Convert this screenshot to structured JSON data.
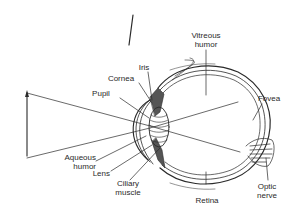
{
  "diagram": {
    "colors": {
      "ink": "#2a2a2a",
      "background": "#ffffff",
      "shade": "#555555"
    },
    "labels": {
      "iris": "Iris",
      "cornea": "Cornea",
      "pupil": "Pupil",
      "vitreous_line1": "Vitreous",
      "vitreous_line2": "humor",
      "fovea": "Fovea",
      "aqueous_line1": "Aqueous",
      "aqueous_line2": "humor",
      "lens": "Lens",
      "ciliary_line1": "Ciliary",
      "ciliary_line2": "muscle",
      "retina": "Retina",
      "optic_line1": "Optic",
      "optic_line2": "nerve"
    },
    "elements": [
      "object-arrow",
      "light-rays",
      "cornea",
      "iris",
      "lens",
      "eyeball-wall",
      "optic-nerve",
      "inverted-image-line"
    ]
  }
}
